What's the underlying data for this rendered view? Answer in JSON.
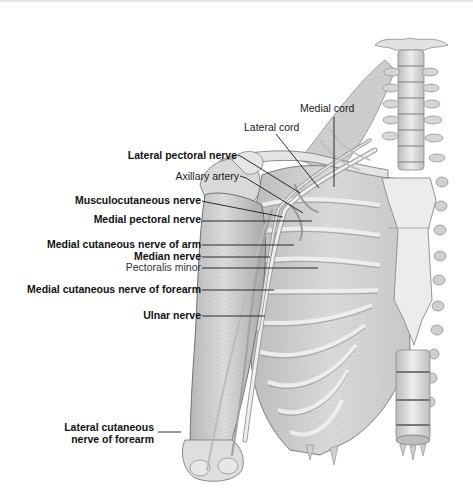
{
  "diagram": {
    "labels": [
      {
        "id": "medial-cord",
        "text": "Medial cord",
        "weight": "normal"
      },
      {
        "id": "lateral-cord",
        "text": "Lateral cord",
        "weight": "normal"
      },
      {
        "id": "lateral-pectoral-nerve",
        "text": "Lateral pectoral nerve",
        "weight": "bold"
      },
      {
        "id": "axillary-artery",
        "text": "Axillary artery",
        "weight": "normal"
      },
      {
        "id": "musculocutaneous-nerve",
        "text": "Musculocutaneous nerve",
        "weight": "bold"
      },
      {
        "id": "medial-pectoral-nerve",
        "text": "Medial pectoral nerve",
        "weight": "bold"
      },
      {
        "id": "medial-cutaneous-nerve-of-arm",
        "text": "Medial cutaneous nerve of arm",
        "weight": "bold"
      },
      {
        "id": "median-nerve",
        "text": "Median nerve",
        "weight": "bold"
      },
      {
        "id": "pectoralis-minor",
        "text": "Pectoralis minor",
        "weight": "normal"
      },
      {
        "id": "medial-cutaneous-nerve-of-forearm",
        "text": "Medial cutaneous nerve of forearm",
        "weight": "bold"
      },
      {
        "id": "ulnar-nerve",
        "text": "Ulnar nerve",
        "weight": "bold"
      },
      {
        "id": "lateral-cutaneous-nerve-of-forearm",
        "text": "Lateral cutaneous nerve of forearm",
        "weight": "bold"
      }
    ],
    "colors": {
      "background": "#ffffff",
      "illustration_light": "#e9e9e9",
      "illustration_mid": "#c4c4c4",
      "illustration_dark": "#8a8a8a",
      "leader_line": "#1a1a1a",
      "text": "#1a1a1a"
    }
  }
}
